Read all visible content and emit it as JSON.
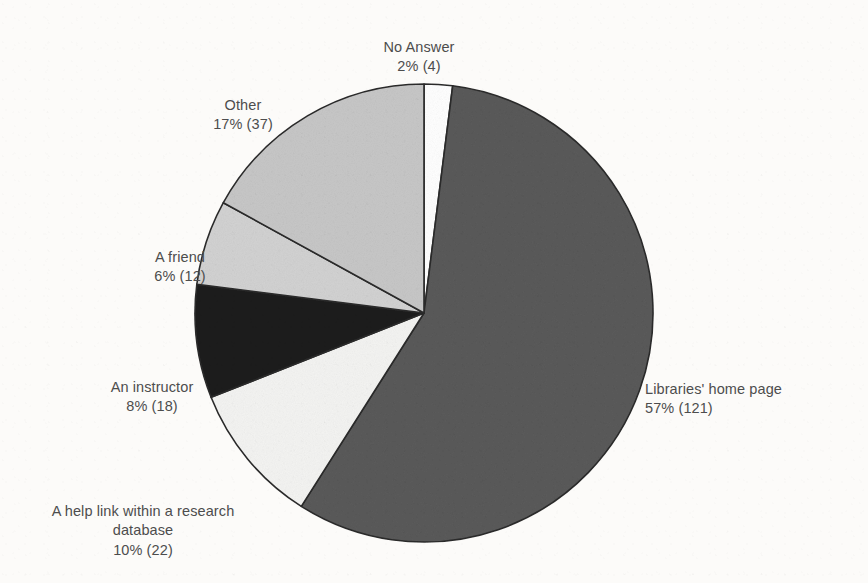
{
  "figure": {
    "kind": "pie-chart",
    "background_color": "#fcfbf9",
    "text_color": "#4d4d4d",
    "outline_color": "#2b2b2b"
  },
  "chart_data": {
    "type": "pie",
    "title": "",
    "subtitle": "",
    "xlabel": "",
    "ylabel": "",
    "grid": false,
    "legend_position": "none",
    "label_format": "{percent}% ({count})",
    "start_angle_deg": 0,
    "direction": "clockwise",
    "total_count": 214,
    "categories": [
      "No Answer",
      "Libraries' home page",
      "A help link within a research database",
      "An instructor",
      "A friend",
      "Other"
    ],
    "values": [
      2,
      57,
      10,
      8,
      6,
      17
    ],
    "counts": [
      4,
      121,
      22,
      18,
      12,
      37
    ],
    "colors": [
      "#ffffff",
      "#5a5a5a",
      "#f4f4f2",
      "#1e1e1e",
      "#d2d2d2",
      "#c7c7c7"
    ],
    "slices": [
      {
        "name": "No Answer",
        "percent": 2,
        "count": 4,
        "color": "#ffffff",
        "label_name": "No Answer",
        "label_value": "2% (4)"
      },
      {
        "name": "Libraries' home page",
        "percent": 57,
        "count": 121,
        "color": "#5a5a5a",
        "label_name": "Libraries' home page",
        "label_value": "57% (121)"
      },
      {
        "name": "A help link within a research database",
        "percent": 10,
        "count": 22,
        "color": "#f4f4f2",
        "label_name": "A help link within a research\ndatabase",
        "label_value": "10% (22)"
      },
      {
        "name": "An instructor",
        "percent": 8,
        "count": 18,
        "color": "#1e1e1e",
        "label_name": "An instructor",
        "label_value": "8% (18)"
      },
      {
        "name": "A friend",
        "percent": 6,
        "count": 12,
        "color": "#d2d2d2",
        "label_name": "A friend",
        "label_value": "6% (12)"
      },
      {
        "name": "Other",
        "percent": 17,
        "count": 37,
        "color": "#c7c7c7",
        "label_name": "Other",
        "label_value": "17% (37)"
      }
    ]
  }
}
